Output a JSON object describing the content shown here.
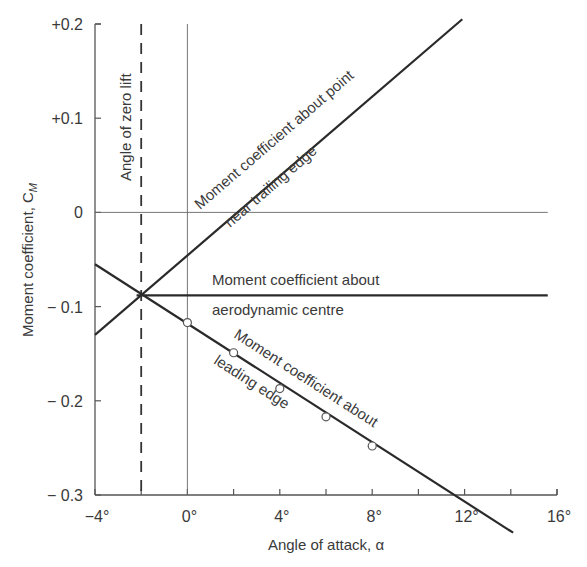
{
  "chart_data": {
    "type": "line",
    "title": "",
    "xlabel": "Angle of attack, α",
    "ylabel": "Moment coefficient, C",
    "ylabel_subscript": "M",
    "xlim": [
      -4,
      16
    ],
    "ylim": [
      -0.3,
      0.2
    ],
    "grid": false,
    "x_ticks": [
      -4,
      -2,
      0,
      2,
      4,
      6,
      8,
      10,
      12,
      14,
      16
    ],
    "x_tick_labels": [
      "−4°",
      "0°",
      "4°",
      "8°",
      "12°",
      "16°"
    ],
    "x_tick_label_values": [
      -4,
      0,
      4,
      8,
      12,
      16
    ],
    "y_ticks": [
      0.2,
      0.1,
      0,
      -0.1,
      -0.2,
      -0.3
    ],
    "y_tick_labels": [
      "+0.2",
      "+0.1",
      "0",
      "− 0.1",
      "− 0.2",
      "− 0.3"
    ],
    "reference_lines": [
      {
        "name": "zero-moment-line",
        "axis": "y",
        "value": 0,
        "x_range": [
          -4,
          15.6
        ]
      },
      {
        "name": "zero-alpha-line",
        "axis": "x",
        "value": 0
      }
    ],
    "zero_lift": {
      "alpha": -2,
      "label": "Angle of zero lift",
      "style": "dashed"
    },
    "series": [
      {
        "name": "Moment coefficient about point near trailing edge",
        "label_line1": "Moment coefficient about point",
        "label_line2": "near trailing edge",
        "x": [
          -4,
          11.9
        ],
        "y": [
          -0.13,
          0.205
        ]
      },
      {
        "name": "Moment coefficient about aerodynamic centre",
        "label_line1": "Moment coefficient about",
        "label_line2": "aerodynamic centre",
        "x": [
          -2.2,
          15.6
        ],
        "y": [
          -0.088,
          -0.088
        ]
      },
      {
        "name": "Moment coefficient about leading edge",
        "label_line1": "Moment coefficient about",
        "label_line2": "leading edge",
        "x": [
          -4,
          14.1
        ],
        "y": [
          -0.055,
          -0.34
        ]
      }
    ],
    "measured_points": {
      "name": "Leading edge measurements",
      "marker": "open-circle",
      "x": [
        0,
        2,
        4,
        6,
        8
      ],
      "y": [
        -0.117,
        -0.149,
        -0.187,
        -0.217,
        -0.248
      ]
    },
    "intersection": {
      "alpha": -2,
      "cm": -0.088
    }
  }
}
